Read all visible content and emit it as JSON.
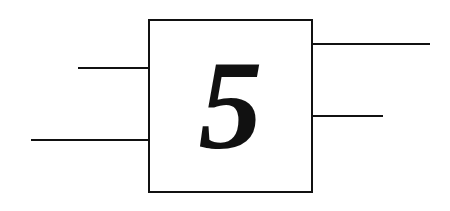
{
  "diagram": {
    "block": {
      "label": "5"
    },
    "inputs": [
      {
        "id": "in-1",
        "y": 67
      },
      {
        "id": "in-2",
        "y": 139
      }
    ],
    "outputs": [
      {
        "id": "out-1",
        "y": 43
      },
      {
        "id": "out-2",
        "y": 115
      }
    ],
    "colors": {
      "stroke": "#111111",
      "background": "#ffffff"
    }
  }
}
